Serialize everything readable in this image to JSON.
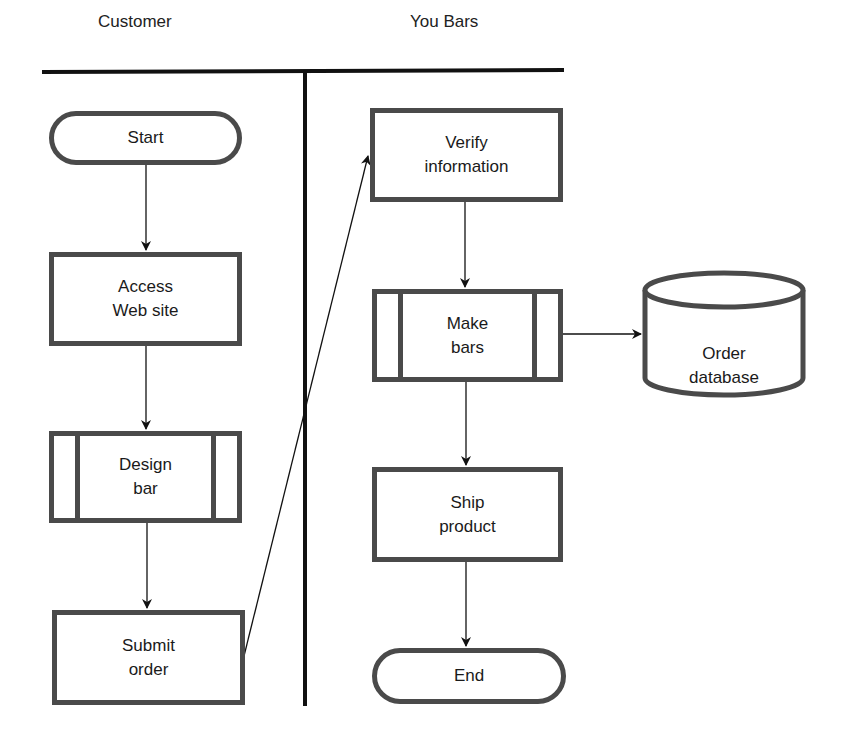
{
  "lanes": [
    {
      "label": "Customer"
    },
    {
      "label": "You Bars"
    }
  ],
  "nodes": {
    "start": {
      "label": "Start",
      "shape": "terminal"
    },
    "access": {
      "label": "Access\nWeb site",
      "shape": "process"
    },
    "design": {
      "label": "Design\nbar",
      "shape": "predefined-process"
    },
    "submit": {
      "label": "Submit\norder",
      "shape": "process"
    },
    "verify": {
      "label": "Verify\ninformation",
      "shape": "process"
    },
    "make": {
      "label": "Make\nbars",
      "shape": "predefined-process"
    },
    "database": {
      "label": "Order\ndatabase",
      "shape": "database"
    },
    "ship": {
      "label": "Ship\nproduct",
      "shape": "process"
    },
    "end": {
      "label": "End",
      "shape": "terminal"
    }
  },
  "edges": [
    {
      "from": "start",
      "to": "access"
    },
    {
      "from": "access",
      "to": "design"
    },
    {
      "from": "design",
      "to": "submit"
    },
    {
      "from": "submit",
      "to": "verify"
    },
    {
      "from": "verify",
      "to": "make"
    },
    {
      "from": "make",
      "to": "database"
    },
    {
      "from": "make",
      "to": "ship"
    },
    {
      "from": "ship",
      "to": "end"
    }
  ],
  "colors": {
    "stroke": "#4a4a4a",
    "line": "#111111",
    "background": "#ffffff"
  }
}
